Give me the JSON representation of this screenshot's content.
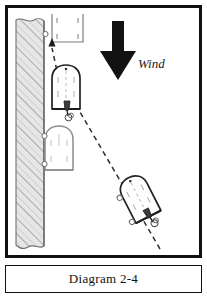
{
  "caption": {
    "text": "Diagram 2-4"
  },
  "diagram": {
    "background_color": "#ffffff",
    "frame_color": "#111111",
    "wind": {
      "label": "Wind",
      "direction": "down",
      "arrow_color": "#111111"
    },
    "dock": {
      "name": "pier",
      "fill_color": "#e3e3e3",
      "hatch_color": "#8a8a8a",
      "outline_color": "#555555"
    },
    "slip": {
      "name": "empty-slip",
      "outline_color": "#777777"
    },
    "boats": [
      {
        "id": "boat-upwind",
        "label": "",
        "state": "approaching",
        "rotation_deg": 0,
        "outline_color": "#222222"
      },
      {
        "id": "boat-docked",
        "label": "",
        "state": "ghost-alongside",
        "rotation_deg": 0,
        "outline_color": "#8c8c8c"
      },
      {
        "id": "boat-start",
        "label": "",
        "state": "start",
        "rotation_deg": -27,
        "outline_color": "#222222"
      }
    ],
    "path": {
      "name": "approach-track",
      "style": "dashed",
      "color": "#333333",
      "arrow_at": "top"
    }
  }
}
